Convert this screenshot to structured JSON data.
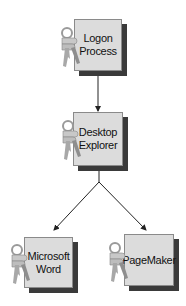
{
  "diagram": {
    "nodes": [
      {
        "id": "logon",
        "lines": [
          "Logon",
          "Process"
        ],
        "icon": "keys-icon"
      },
      {
        "id": "desktop",
        "lines": [
          "Desktop",
          "Explorer"
        ],
        "icon": "keys-icon"
      },
      {
        "id": "word",
        "lines": [
          "Microsoft",
          "Word"
        ],
        "icon": "keys-icon"
      },
      {
        "id": "pagemaker",
        "lines": [
          "PageMaker"
        ],
        "icon": "keys-icon"
      }
    ],
    "edges": [
      {
        "from": "logon",
        "to": "desktop"
      },
      {
        "from": "desktop",
        "to": "word"
      },
      {
        "from": "desktop",
        "to": "pagemaker"
      }
    ],
    "colors": {
      "box_fill": "#dcdcdc",
      "box_shadow": "#3a3a3a",
      "arrow": "#222222"
    }
  }
}
